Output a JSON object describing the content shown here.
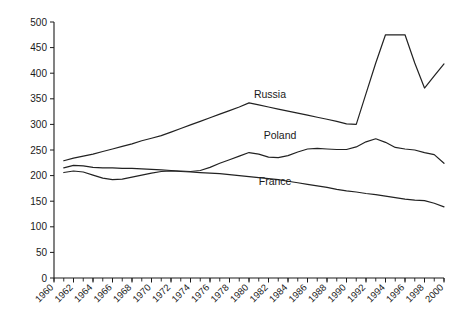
{
  "chart_data": {
    "type": "line",
    "title": "",
    "subtitle": "",
    "xlabel": "",
    "ylabel": "",
    "xlim": [
      1960,
      2000
    ],
    "ylim": [
      0,
      500
    ],
    "ytick_step": 50,
    "xtick_step": 2,
    "x_minor_tick_step": 1,
    "grid": false,
    "legend": "inline-labels",
    "ytick_labels": [
      "0",
      "50",
      "100",
      "150",
      "200",
      "250",
      "300",
      "350",
      "400",
      "450",
      "500"
    ],
    "ytick_values": [
      0,
      50,
      100,
      150,
      200,
      250,
      300,
      350,
      400,
      450,
      500
    ],
    "xtick_labels": [
      "1960",
      "1962",
      "1964",
      "1966",
      "1968",
      "1970",
      "1972",
      "1974",
      "1976",
      "1978",
      "1980",
      "1982",
      "1984",
      "1986",
      "1988",
      "1990",
      "1992",
      "1994",
      "1996",
      "1998",
      "2000"
    ],
    "xtick_values": [
      1960,
      1962,
      1964,
      1966,
      1968,
      1970,
      1972,
      1974,
      1976,
      1978,
      1980,
      1982,
      1984,
      1986,
      1988,
      1990,
      1992,
      1994,
      1996,
      1998,
      2000
    ],
    "x": [
      1961,
      1962,
      1963,
      1964,
      1965,
      1966,
      1967,
      1968,
      1969,
      1970,
      1971,
      1972,
      1973,
      1974,
      1975,
      1976,
      1977,
      1978,
      1979,
      1980,
      1981,
      1982,
      1983,
      1984,
      1985,
      1986,
      1987,
      1988,
      1989,
      1990,
      1991,
      1992,
      1993,
      1994,
      1995,
      1996,
      1997,
      1998,
      1999,
      2000
    ],
    "series": [
      {
        "name": "Russia",
        "color": "#222222",
        "label_position": {
          "x": 1980.5,
          "y": 352
        },
        "values": [
          229,
          234,
          238,
          242,
          247,
          252,
          257,
          262,
          268,
          273,
          278,
          285,
          292,
          299,
          306,
          313,
          320,
          327,
          334,
          342,
          338,
          334,
          330,
          326,
          322,
          318,
          314,
          310,
          306,
          301,
          300,
          360,
          420,
          475,
          475,
          475,
          420,
          371,
          395,
          418
        ]
      },
      {
        "name": "Poland",
        "color": "#222222",
        "label_position": {
          "x": 1981.5,
          "y": 272
        },
        "values": [
          215,
          220,
          219,
          216,
          215,
          215,
          214,
          214,
          213,
          212,
          211,
          210,
          209,
          208,
          210,
          216,
          224,
          231,
          238,
          245,
          242,
          236,
          235,
          239,
          246,
          252,
          253,
          252,
          251,
          251,
          256,
          266,
          272,
          265,
          255,
          252,
          250,
          245,
          241,
          224
        ]
      },
      {
        "name": "France",
        "color": "#222222",
        "label_position": {
          "x": 1981.0,
          "y": 182
        },
        "values": [
          206,
          209,
          207,
          201,
          195,
          192,
          193,
          197,
          201,
          205,
          208,
          209,
          208,
          207,
          206,
          205,
          204,
          202,
          200,
          198,
          196,
          194,
          192,
          189,
          186,
          183,
          180,
          177,
          173,
          170,
          168,
          165,
          163,
          160,
          157,
          154,
          152,
          151,
          146,
          139
        ]
      }
    ]
  }
}
